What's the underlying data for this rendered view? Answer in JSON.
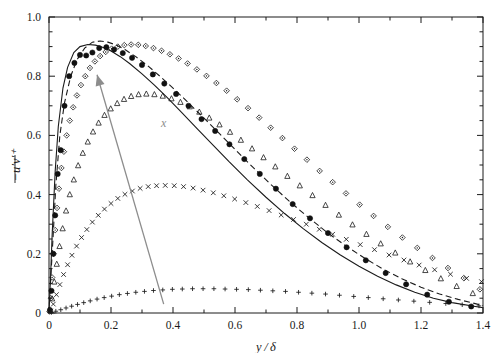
{
  "figure": {
    "background": "#ffffff",
    "frame_color": "#1a1a1a",
    "width": 502,
    "height": 353
  },
  "axes": {
    "x_title": "y / δ",
    "y_title": "−u′v′⁺",
    "x_tick_labels": [
      "0",
      "0.2",
      "0.4",
      "0.6",
      "0.8",
      "1.0",
      "1.2",
      "1.4"
    ],
    "y_tick_labels": [
      "0",
      "0.2",
      "0.4",
      "0.6",
      "0.8",
      "1.0"
    ]
  },
  "annotation": {
    "label": "x",
    "color": "#8d8d8d",
    "arrow_name": "increasing-x-arrow"
  },
  "chart_data": {
    "type": "line",
    "title": "",
    "xlabel": "y / δ",
    "ylabel": "-u'v'+",
    "xlim": [
      0,
      1.4
    ],
    "ylim": [
      0,
      1.0
    ],
    "xticks": [
      0,
      0.2,
      0.4,
      0.6,
      0.8,
      1.0,
      1.2,
      1.4
    ],
    "yticks": [
      0,
      0.2,
      0.4,
      0.6,
      0.8,
      1.0
    ],
    "minor_tick_step_x": 0.1,
    "minor_tick_step_y": 0.05,
    "grid": false,
    "legend": "none",
    "annotations": [
      {
        "text": "x",
        "x": 0.37,
        "y": 0.63,
        "color": "#8d8d8d",
        "arrow_from": [
          0.37,
          0.03
        ],
        "arrow_to": [
          0.155,
          0.805
        ]
      }
    ],
    "series": [
      {
        "name": "solid-line",
        "style": "line",
        "marker": "none",
        "linestyle": "solid",
        "color": "#1a1a1a",
        "x": [
          0.0,
          0.005,
          0.01,
          0.02,
          0.03,
          0.045,
          0.06,
          0.08,
          0.1,
          0.125,
          0.15,
          0.175,
          0.2,
          0.23,
          0.26,
          0.3,
          0.34,
          0.38,
          0.43,
          0.48,
          0.53,
          0.58,
          0.64,
          0.7,
          0.76,
          0.82,
          0.88,
          0.94,
          1.0,
          1.06,
          1.12,
          1.18,
          1.24,
          1.3,
          1.4
        ],
        "y": [
          0.0,
          0.12,
          0.26,
          0.48,
          0.63,
          0.76,
          0.83,
          0.88,
          0.9,
          0.907,
          0.905,
          0.897,
          0.885,
          0.866,
          0.843,
          0.808,
          0.77,
          0.729,
          0.675,
          0.62,
          0.566,
          0.512,
          0.45,
          0.391,
          0.336,
          0.285,
          0.238,
          0.196,
          0.158,
          0.124,
          0.095,
          0.07,
          0.05,
          0.035,
          0.018
        ]
      },
      {
        "name": "dashed-line",
        "style": "line",
        "marker": "none",
        "linestyle": "dashed",
        "color": "#1a1a1a",
        "x": [
          0.0,
          0.005,
          0.012,
          0.022,
          0.035,
          0.05,
          0.07,
          0.09,
          0.115,
          0.14,
          0.165,
          0.19,
          0.215,
          0.245,
          0.28,
          0.32,
          0.36,
          0.4,
          0.45,
          0.5,
          0.55,
          0.6,
          0.66,
          0.72,
          0.78,
          0.84,
          0.9,
          0.96,
          1.02,
          1.08,
          1.14,
          1.2,
          1.26,
          1.32,
          1.4
        ],
        "y": [
          0.0,
          0.105,
          0.235,
          0.43,
          0.6,
          0.71,
          0.8,
          0.855,
          0.895,
          0.915,
          0.919,
          0.915,
          0.906,
          0.89,
          0.866,
          0.834,
          0.798,
          0.76,
          0.71,
          0.658,
          0.606,
          0.553,
          0.49,
          0.43,
          0.373,
          0.32,
          0.27,
          0.225,
          0.184,
          0.147,
          0.115,
          0.087,
          0.064,
          0.046,
          0.025
        ]
      },
      {
        "name": "filled-circles",
        "style": "markers",
        "marker": "filled-circle",
        "color": "#111111",
        "x": [
          0.003,
          0.008,
          0.014,
          0.02,
          0.028,
          0.038,
          0.05,
          0.065,
          0.082,
          0.1,
          0.12,
          0.14,
          0.162,
          0.185,
          0.21,
          0.238,
          0.268,
          0.3,
          0.335,
          0.372,
          0.41,
          0.45,
          0.492,
          0.536,
          0.582,
          0.63,
          0.68,
          0.732,
          0.786,
          0.842,
          0.9,
          0.96,
          1.022,
          1.086,
          1.152,
          1.22,
          1.29,
          1.362
        ],
        "y": [
          0.01,
          0.075,
          0.2,
          0.33,
          0.47,
          0.55,
          0.7,
          0.8,
          0.845,
          0.872,
          0.87,
          0.88,
          0.895,
          0.898,
          0.89,
          0.878,
          0.862,
          0.838,
          0.806,
          0.775,
          0.74,
          0.7,
          0.655,
          0.615,
          0.57,
          0.52,
          0.47,
          0.42,
          0.368,
          0.32,
          0.27,
          0.222,
          0.178,
          0.135,
          0.097,
          0.062,
          0.038,
          0.022
        ]
      },
      {
        "name": "open-diamonds",
        "style": "markers",
        "marker": "open-diamond",
        "color": "#1a1a1a",
        "x": [
          0.002,
          0.006,
          0.01,
          0.015,
          0.02,
          0.026,
          0.032,
          0.04,
          0.048,
          0.057,
          0.067,
          0.078,
          0.09,
          0.103,
          0.117,
          0.132,
          0.148,
          0.165,
          0.183,
          0.202,
          0.222,
          0.243,
          0.265,
          0.288,
          0.312,
          0.337,
          0.363,
          0.39,
          0.418,
          0.447,
          0.477,
          0.508,
          0.54,
          0.573,
          0.607,
          0.642,
          0.678,
          0.715,
          0.753,
          0.792,
          0.832,
          0.873,
          0.915,
          0.958,
          1.002,
          1.047,
          1.093,
          1.14,
          1.188,
          1.237,
          1.287,
          1.338,
          1.39
        ],
        "y": [
          0.005,
          0.05,
          0.12,
          0.2,
          0.28,
          0.355,
          0.42,
          0.49,
          0.545,
          0.6,
          0.65,
          0.695,
          0.735,
          0.77,
          0.8,
          0.828,
          0.85,
          0.868,
          0.882,
          0.893,
          0.9,
          0.905,
          0.907,
          0.906,
          0.902,
          0.895,
          0.886,
          0.874,
          0.86,
          0.843,
          0.823,
          0.801,
          0.777,
          0.751,
          0.722,
          0.692,
          0.66,
          0.626,
          0.591,
          0.555,
          0.518,
          0.48,
          0.442,
          0.404,
          0.366,
          0.328,
          0.291,
          0.255,
          0.22,
          0.186,
          0.152,
          0.118,
          0.08
        ]
      },
      {
        "name": "open-triangles",
        "style": "markers",
        "marker": "open-triangle",
        "color": "#1a1a1a",
        "x": [
          0.004,
          0.01,
          0.017,
          0.025,
          0.034,
          0.044,
          0.055,
          0.067,
          0.08,
          0.094,
          0.109,
          0.125,
          0.142,
          0.16,
          0.179,
          0.199,
          0.22,
          0.242,
          0.265,
          0.289,
          0.314,
          0.34,
          0.367,
          0.395,
          0.424,
          0.454,
          0.485,
          0.517,
          0.55,
          0.584,
          0.619,
          0.655,
          0.692,
          0.73,
          0.769,
          0.809,
          0.85,
          0.892,
          0.935,
          0.979,
          1.024,
          1.07,
          1.117,
          1.165,
          1.214,
          1.264,
          1.315,
          1.367
        ],
        "y": [
          0.008,
          0.048,
          0.105,
          0.165,
          0.225,
          0.285,
          0.345,
          0.4,
          0.45,
          0.498,
          0.54,
          0.578,
          0.612,
          0.642,
          0.668,
          0.69,
          0.708,
          0.722,
          0.732,
          0.738,
          0.74,
          0.738,
          0.733,
          0.724,
          0.712,
          0.697,
          0.679,
          0.659,
          0.636,
          0.611,
          0.584,
          0.555,
          0.525,
          0.494,
          0.462,
          0.43,
          0.397,
          0.364,
          0.331,
          0.298,
          0.266,
          0.234,
          0.203,
          0.173,
          0.144,
          0.116,
          0.09,
          0.066
        ]
      },
      {
        "name": "crosses",
        "style": "markers",
        "marker": "cross",
        "color": "#1a1a1a",
        "x": [
          0.006,
          0.014,
          0.024,
          0.035,
          0.047,
          0.06,
          0.074,
          0.089,
          0.105,
          0.122,
          0.14,
          0.159,
          0.179,
          0.2,
          0.222,
          0.245,
          0.269,
          0.294,
          0.32,
          0.347,
          0.375,
          0.404,
          0.434,
          0.465,
          0.497,
          0.53,
          0.564,
          0.599,
          0.635,
          0.672,
          0.71,
          0.749,
          0.789,
          0.83,
          0.872,
          0.915,
          0.959,
          1.004,
          1.05,
          1.097,
          1.145,
          1.194,
          1.244,
          1.295,
          1.347,
          1.395
        ],
        "y": [
          0.006,
          0.03,
          0.062,
          0.096,
          0.13,
          0.163,
          0.195,
          0.226,
          0.255,
          0.282,
          0.307,
          0.33,
          0.351,
          0.37,
          0.387,
          0.401,
          0.412,
          0.421,
          0.427,
          0.43,
          0.431,
          0.43,
          0.427,
          0.422,
          0.415,
          0.406,
          0.396,
          0.385,
          0.373,
          0.36,
          0.346,
          0.331,
          0.316,
          0.3,
          0.283,
          0.266,
          0.249,
          0.231,
          0.214,
          0.196,
          0.179,
          0.162,
          0.146,
          0.131,
          0.117,
          0.106
        ]
      },
      {
        "name": "plus-signs",
        "style": "markers",
        "marker": "plus",
        "color": "#1a1a1a",
        "x": [
          0.008,
          0.022,
          0.038,
          0.055,
          0.073,
          0.092,
          0.112,
          0.133,
          0.155,
          0.178,
          0.202,
          0.227,
          0.253,
          0.28,
          0.308,
          0.337,
          0.367,
          0.398,
          0.43,
          0.463,
          0.497,
          0.532,
          0.568,
          0.605,
          0.643,
          0.682,
          0.722,
          0.763,
          0.805,
          0.848,
          0.892,
          0.937,
          0.983,
          1.03,
          1.078,
          1.127,
          1.177,
          1.228,
          1.28,
          1.333,
          1.387
        ],
        "y": [
          0.002,
          0.006,
          0.011,
          0.017,
          0.023,
          0.029,
          0.035,
          0.041,
          0.047,
          0.052,
          0.057,
          0.062,
          0.066,
          0.07,
          0.073,
          0.076,
          0.078,
          0.08,
          0.081,
          0.082,
          0.082,
          0.082,
          0.081,
          0.08,
          0.079,
          0.077,
          0.075,
          0.073,
          0.07,
          0.067,
          0.064,
          0.06,
          0.056,
          0.052,
          0.048,
          0.044,
          0.04,
          0.036,
          0.032,
          0.028,
          0.024
        ]
      }
    ]
  }
}
